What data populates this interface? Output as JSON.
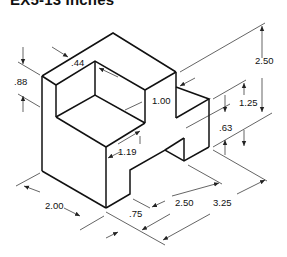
{
  "title": "EX5-13 Inches",
  "units": "Inches",
  "dimensions": {
    "d_088": ".88",
    "d_044": ".44",
    "d_100": "1.00",
    "d_119": "1.19",
    "d_250_height": "2.50",
    "d_125": "1.25",
    "d_063": ".63",
    "d_200": "2.00",
    "d_075": ".75",
    "d_250_width": "2.50",
    "d_325": "3.25"
  },
  "colors": {
    "line": "#111111",
    "background": "#ffffff"
  }
}
